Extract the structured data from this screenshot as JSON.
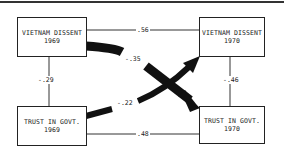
{
  "diagram": {
    "type": "cross-lagged panel",
    "nodes": {
      "vd69": {
        "line1": "VIETNAM DISSENT",
        "line2": "1969"
      },
      "vd70": {
        "line1": "VIETNAM DISSENT",
        "line2": "1970"
      },
      "tg69": {
        "line1": "TRUST IN GOVT.",
        "line2": "1969"
      },
      "tg70": {
        "line1": "TRUST IN GOVT.",
        "line2": "1970"
      }
    },
    "edges": {
      "vd69_vd70": ".56",
      "tg69_tg70": ".48",
      "vd69_tg69": "-.29",
      "vd70_tg70": "-.46",
      "vd69_tg70": "-.35",
      "tg69_vd70": "-.22"
    }
  }
}
